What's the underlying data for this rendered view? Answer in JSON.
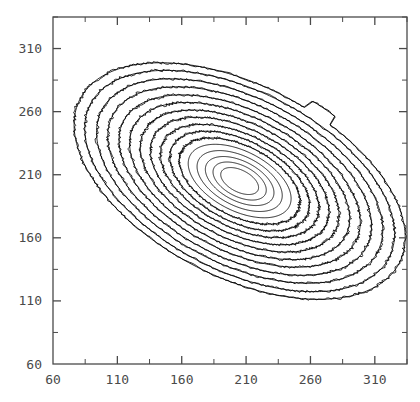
{
  "chart_data": {
    "type": "line",
    "title": "",
    "subtitle": "",
    "xlabel": "",
    "ylabel": "",
    "xlim": [
      60,
      335
    ],
    "ylim": [
      60,
      335
    ],
    "grid": false,
    "legend": null,
    "xticks": [
      60,
      110,
      160,
      210,
      260,
      310
    ],
    "yticks": [
      60,
      110,
      160,
      210,
      260,
      310
    ],
    "xtick_labels": [
      "60",
      "110",
      "160",
      "210",
      "260",
      "310"
    ],
    "ytick_labels": [
      "60",
      "110",
      "160",
      "210",
      "260",
      "310"
    ],
    "minor_tick_step": 25,
    "tick_direction": "in",
    "frame": "full-box",
    "line_color": "#000000",
    "axis_color": "#4a4a4a",
    "background_color": "#ffffff",
    "center": [
      205,
      205
    ],
    "rotation_deg": -28,
    "axis_ratio": 1.85,
    "n_contours": 16,
    "series": [
      {
        "name": "contour-16",
        "level": 1,
        "semi_major": 140.0,
        "semi_minor": 75.7,
        "jagged": true
      },
      {
        "name": "contour-15",
        "level": 2,
        "semi_major": 131.0,
        "semi_minor": 70.8,
        "jagged": true
      },
      {
        "name": "contour-14",
        "level": 3,
        "semi_major": 121.0,
        "semi_minor": 65.4,
        "jagged": true
      },
      {
        "name": "contour-13",
        "level": 4,
        "semi_major": 111.5,
        "semi_minor": 60.3,
        "jagged": true
      },
      {
        "name": "contour-12",
        "level": 5,
        "semi_major": 102.0,
        "semi_minor": 55.1,
        "jagged": true
      },
      {
        "name": "contour-11",
        "level": 6,
        "semi_major": 93.0,
        "semi_minor": 50.3,
        "jagged": true
      },
      {
        "name": "contour-10",
        "level": 7,
        "semi_major": 84.0,
        "semi_minor": 45.4,
        "jagged": true
      },
      {
        "name": "contour-9",
        "level": 8,
        "semi_major": 75.5,
        "semi_minor": 40.8,
        "jagged": true
      },
      {
        "name": "contour-8",
        "level": 9,
        "semi_major": 67.0,
        "semi_minor": 36.2,
        "jagged": true
      },
      {
        "name": "contour-7",
        "level": 10,
        "semi_major": 59.0,
        "semi_minor": 31.9,
        "jagged": true
      },
      {
        "name": "contour-6",
        "level": 11,
        "semi_major": 51.0,
        "semi_minor": 27.6,
        "jagged": true
      },
      {
        "name": "contour-5",
        "level": 12,
        "semi_major": 43.5,
        "semi_minor": 23.5,
        "jagged": false
      },
      {
        "name": "contour-4",
        "level": 13,
        "semi_major": 36.0,
        "semi_minor": 19.5,
        "jagged": false
      },
      {
        "name": "contour-3",
        "level": 14,
        "semi_major": 29.0,
        "semi_minor": 15.7,
        "jagged": false
      },
      {
        "name": "contour-2",
        "level": 15,
        "semi_major": 22.5,
        "semi_minor": 12.2,
        "jagged": false
      },
      {
        "name": "contour-1",
        "level": 16,
        "semi_major": 16.0,
        "semi_minor": 8.6,
        "jagged": false
      }
    ],
    "artifacts": [
      {
        "name": "bump-top-outer",
        "contour": "contour-16",
        "angle_deg": 78,
        "size": 9
      }
    ]
  }
}
